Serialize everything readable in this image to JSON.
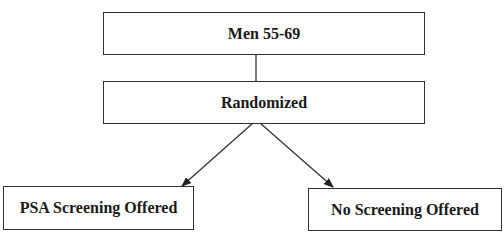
{
  "diagram": {
    "type": "flowchart",
    "nodes": [
      {
        "id": "men",
        "label": "Men 55-69"
      },
      {
        "id": "randomized",
        "label": "Randomized"
      },
      {
        "id": "psa",
        "label": "PSA Screening Offered"
      },
      {
        "id": "none",
        "label": "No Screening Offered"
      }
    ],
    "edges": [
      {
        "from": "men",
        "to": "randomized",
        "style": "line"
      },
      {
        "from": "randomized",
        "to": "psa",
        "style": "arrow"
      },
      {
        "from": "randomized",
        "to": "none",
        "style": "arrow"
      }
    ],
    "colors": {
      "border": "#333333",
      "text": "#1a1a1a",
      "background": "#ffffff"
    }
  }
}
